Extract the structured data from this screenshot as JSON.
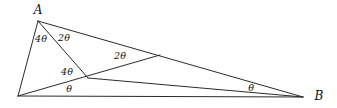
{
  "figure": {
    "type": "geometry-diagram",
    "width": 337,
    "height": 108,
    "background_color": "#ffffff",
    "stroke_color": "#2b2b2b",
    "text_color": "#111111",
    "points": {
      "A": {
        "x": 38,
        "y": 21
      },
      "B": {
        "x": 303,
        "y": 97
      },
      "C": {
        "x": 18,
        "y": 96
      },
      "D": {
        "x": 88,
        "y": 78
      },
      "E": {
        "x": 160,
        "y": 55
      },
      "X": {
        "x": 157,
        "y": 57
      }
    },
    "segments": [
      {
        "name": "side-AC",
        "from": "A",
        "to": "C"
      },
      {
        "name": "side-CB",
        "from": "C",
        "to": "B"
      },
      {
        "name": "side-AB",
        "from": "A",
        "to": "B"
      },
      {
        "name": "cevian-AD",
        "from": "A",
        "to": "D"
      },
      {
        "name": "cevian-DE-to-B",
        "from": "D",
        "to": "B"
      },
      {
        "name": "segment-DE",
        "from": "D",
        "to": "E"
      }
    ],
    "vertex_labels": [
      {
        "name": "vertex-label-A",
        "text": "A",
        "x": 38,
        "y": 10
      },
      {
        "name": "vertex-label-B",
        "text": "B",
        "x": 319,
        "y": 96
      }
    ],
    "angle_labels": [
      {
        "name": "angle-4theta-at-A-left",
        "text": "4θ",
        "x": 41,
        "y": 39
      },
      {
        "name": "angle-2theta-at-A-right",
        "text": "2θ",
        "x": 64,
        "y": 38
      },
      {
        "name": "angle-4theta-at-D",
        "text": "4θ",
        "x": 67,
        "y": 72
      },
      {
        "name": "angle-2theta-at-E",
        "text": "2θ",
        "x": 120,
        "y": 56
      },
      {
        "name": "angle-theta-at-C",
        "text": "θ",
        "x": 69,
        "y": 89
      },
      {
        "name": "angle-theta-at-B",
        "text": "θ",
        "x": 251,
        "y": 88
      }
    ]
  }
}
